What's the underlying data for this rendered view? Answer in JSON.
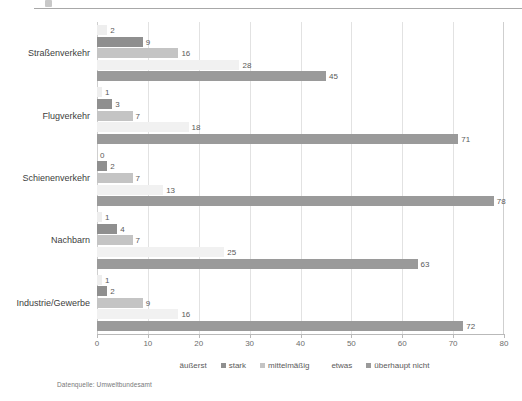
{
  "source_note": "Datenquelle: Umweltbundesamt",
  "legend": {
    "position": "bottom-center",
    "items": [
      {
        "label": "äußerst",
        "color": "#eeeeee",
        "has_marker": false
      },
      {
        "label": "stark",
        "color": "#8f8f8f",
        "has_marker": true
      },
      {
        "label": "mittelmäßig",
        "color": "#c4c4c4",
        "has_marker": true
      },
      {
        "label": "etwas",
        "color": "#f1f1f1",
        "has_marker": false
      },
      {
        "label": "überhaupt nicht",
        "color": "#9a9a9a",
        "has_marker": true
      }
    ]
  },
  "chart_data": {
    "type": "bar",
    "orientation": "horizontal",
    "title": "",
    "subtitle": "",
    "xlabel": "",
    "ylabel": "",
    "xlim": [
      0,
      80
    ],
    "xticks": [
      0,
      10,
      20,
      30,
      40,
      50,
      60,
      70,
      80
    ],
    "xtick_labels": [
      "0",
      "10",
      "20",
      "30",
      "40",
      "50",
      "60",
      "70",
      "80"
    ],
    "grid": "vertical",
    "show_data_labels": true,
    "categories": [
      "Straßenverkehr",
      "Flugverkehr",
      "Schienenverkehr",
      "Nachbarn",
      "Industrie/Gewerbe"
    ],
    "series": [
      {
        "name": "äußerst",
        "color": "#eeeeee",
        "values": [
          2,
          1,
          0,
          1,
          1
        ]
      },
      {
        "name": "stark",
        "color": "#8f8f8f",
        "values": [
          9,
          3,
          2,
          4,
          2
        ]
      },
      {
        "name": "mittelmäßig",
        "color": "#c4c4c4",
        "values": [
          16,
          7,
          7,
          7,
          9
        ]
      },
      {
        "name": "etwas",
        "color": "#f1f1f1",
        "values": [
          28,
          18,
          13,
          25,
          16
        ]
      },
      {
        "name": "überhaupt nicht",
        "color": "#9a9a9a",
        "values": [
          45,
          71,
          78,
          63,
          72
        ]
      }
    ]
  }
}
